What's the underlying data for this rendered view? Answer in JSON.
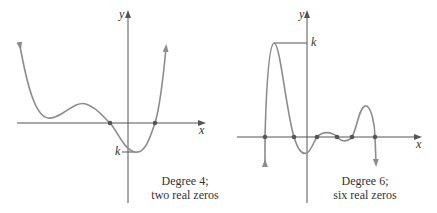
{
  "graphs": [
    {
      "axis_x_label": "x",
      "axis_y_label": "y",
      "k_label": "k",
      "caption_line1": "Degree 4;",
      "caption_line2": "two real zeros",
      "degree": 4,
      "real_zeros": 2
    },
    {
      "axis_x_label": "x",
      "axis_y_label": "y",
      "k_label": "k",
      "caption_line1": "Degree 6;",
      "caption_line2": "six real zeros",
      "degree": 6,
      "real_zeros": 6
    }
  ],
  "colors": {
    "axis": "#555555",
    "curve": "#8c8c8c",
    "point": "#555555",
    "text": "#333333"
  }
}
